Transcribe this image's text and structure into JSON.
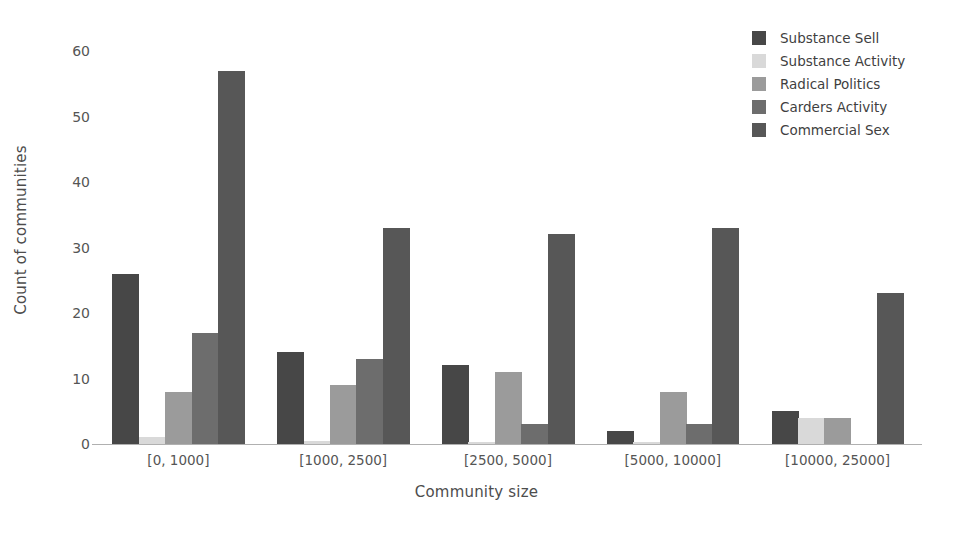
{
  "chart_data": {
    "type": "bar",
    "title": "",
    "xlabel": "Community size",
    "ylabel": "Count of communities",
    "categories": [
      "[0, 1000]",
      "[1000, 2500]",
      "[2500, 5000]",
      "[5000, 10000]",
      "[10000, 25000]"
    ],
    "ylim": [
      0,
      62
    ],
    "yticks": [
      0,
      10,
      20,
      30,
      40,
      50,
      60
    ],
    "ytick_labels": [
      "0",
      "10",
      "20",
      "30",
      "40",
      "50",
      "60"
    ],
    "grid": false,
    "legend_position": "upper right",
    "series": [
      {
        "name": "Substance Sell",
        "color": "#474747",
        "values": [
          26,
          14,
          12,
          2,
          5
        ]
      },
      {
        "name": "Substance Activity",
        "color": "#d9d9d9",
        "values": [
          1,
          0.5,
          0.3,
          0.3,
          4
        ]
      },
      {
        "name": "Radical Politics",
        "color": "#9b9b9b",
        "values": [
          8,
          9,
          11,
          8,
          4
        ]
      },
      {
        "name": "Carders Activity",
        "color": "#6d6d6d",
        "values": [
          17,
          13,
          3,
          3,
          0
        ]
      },
      {
        "name": "Commercial Sex",
        "color": "#575757",
        "values": [
          57,
          33,
          32,
          33,
          23
        ]
      }
    ]
  },
  "axes": {
    "ylabel_text": "Count of communities",
    "xlabel_text": "Community size"
  }
}
